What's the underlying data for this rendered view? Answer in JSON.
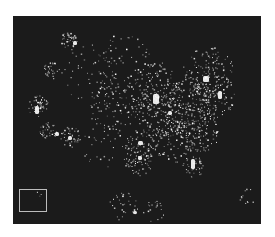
{
  "image": {
    "subject": "night-time satellite view of city lights over the United States",
    "background_color": "#1b1b1b",
    "light_color": "#ffffff",
    "inset_box_color": "#bdbdbd"
  },
  "clusters": [
    {
      "x": 55,
      "y": 25,
      "r": 5,
      "n": 40
    },
    {
      "x": 38,
      "y": 55,
      "r": 5,
      "n": 30
    },
    {
      "x": 25,
      "y": 90,
      "r": 6,
      "n": 50
    },
    {
      "x": 35,
      "y": 115,
      "r": 5,
      "n": 40
    },
    {
      "x": 58,
      "y": 120,
      "r": 6,
      "n": 40
    },
    {
      "x": 100,
      "y": 90,
      "r": 14,
      "n": 80
    },
    {
      "x": 140,
      "y": 70,
      "r": 14,
      "n": 120
    },
    {
      "x": 150,
      "y": 95,
      "r": 16,
      "n": 160
    },
    {
      "x": 175,
      "y": 90,
      "r": 16,
      "n": 160
    },
    {
      "x": 195,
      "y": 55,
      "r": 14,
      "n": 120
    },
    {
      "x": 200,
      "y": 80,
      "r": 12,
      "n": 100
    },
    {
      "x": 185,
      "y": 115,
      "r": 12,
      "n": 100
    },
    {
      "x": 160,
      "y": 125,
      "r": 12,
      "n": 90
    },
    {
      "x": 130,
      "y": 130,
      "r": 10,
      "n": 70
    },
    {
      "x": 125,
      "y": 145,
      "r": 8,
      "n": 50
    },
    {
      "x": 180,
      "y": 150,
      "r": 6,
      "n": 40
    },
    {
      "x": 110,
      "y": 190,
      "r": 8,
      "n": 30
    },
    {
      "x": 140,
      "y": 195,
      "r": 6,
      "n": 20
    },
    {
      "x": 80,
      "y": 60,
      "r": 18,
      "n": 60
    },
    {
      "x": 110,
      "y": 50,
      "r": 18,
      "n": 60
    },
    {
      "x": 90,
      "y": 130,
      "r": 12,
      "n": 30
    },
    {
      "x": 235,
      "y": 180,
      "r": 5,
      "n": 12
    },
    {
      "x": 25,
      "y": 178,
      "r": 2,
      "n": 3
    }
  ],
  "bright_spots": [
    {
      "x": 140,
      "y": 78,
      "w": 6,
      "h": 10
    },
    {
      "x": 190,
      "y": 60,
      "w": 6,
      "h": 6
    },
    {
      "x": 205,
      "y": 75,
      "w": 4,
      "h": 8
    },
    {
      "x": 125,
      "y": 125,
      "w": 5,
      "h": 4
    },
    {
      "x": 125,
      "y": 140,
      "w": 4,
      "h": 4
    },
    {
      "x": 178,
      "y": 143,
      "w": 4,
      "h": 10
    },
    {
      "x": 22,
      "y": 90,
      "w": 4,
      "h": 8
    },
    {
      "x": 42,
      "y": 116,
      "w": 4,
      "h": 4
    },
    {
      "x": 55,
      "y": 120,
      "w": 4,
      "h": 4
    },
    {
      "x": 60,
      "y": 25,
      "w": 4,
      "h": 4
    },
    {
      "x": 155,
      "y": 95,
      "w": 4,
      "h": 4
    },
    {
      "x": 120,
      "y": 195,
      "w": 4,
      "h": 3
    }
  ]
}
